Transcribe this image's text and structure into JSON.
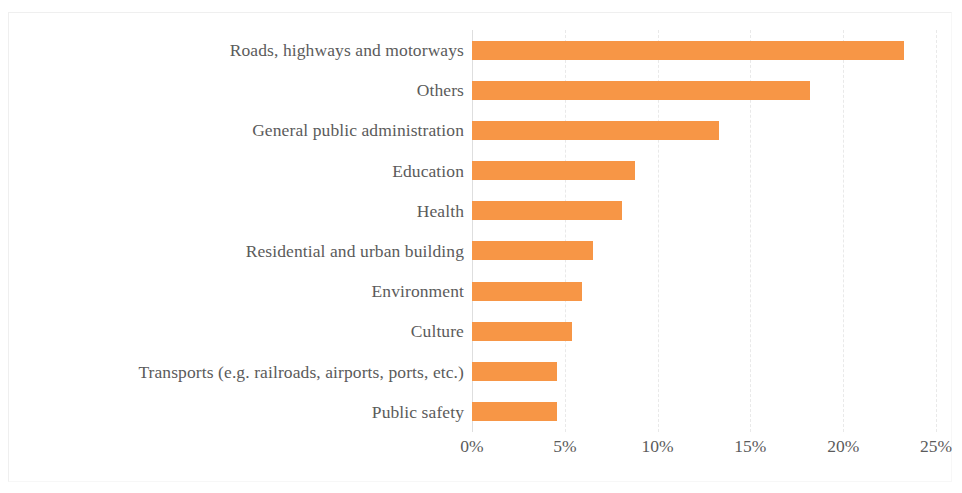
{
  "chart_data": {
    "type": "bar",
    "orientation": "horizontal",
    "title": "",
    "subtitle": "",
    "xlabel": "",
    "ylabel": "",
    "categories": [
      "Roads, highways and motorways",
      "Others",
      "General public administration",
      "Education",
      "Health",
      "Residential and urban building",
      "Environment",
      "Culture",
      "Transports (e.g. railroads, airports, ports, etc.)",
      "Public safety"
    ],
    "values": [
      23.3,
      18.2,
      13.3,
      8.8,
      8.1,
      6.5,
      5.9,
      5.4,
      4.6,
      4.6
    ],
    "value_unit": "%",
    "xlim": [
      0,
      25
    ],
    "xticks": [
      0,
      5,
      10,
      15,
      20,
      25
    ],
    "xtick_labels": [
      "0%",
      "5%",
      "10%",
      "15%",
      "20%",
      "25%"
    ],
    "grid": "vertical-dashed",
    "legend": "none",
    "series": [
      {
        "name": "Share",
        "color": "#F79646",
        "values": [
          23.3,
          18.2,
          13.3,
          8.8,
          8.1,
          6.5,
          5.9,
          5.4,
          4.6,
          4.6
        ]
      }
    ]
  },
  "colors": {
    "bar": "#F79646",
    "label_text": "#5B5B5B",
    "gridline": "#E9E9E9",
    "axis": "#DEDEDE",
    "background": "#FFFFFF"
  }
}
